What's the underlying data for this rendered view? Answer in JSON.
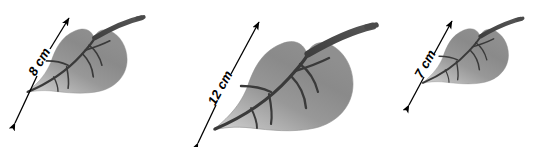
{
  "figure": {
    "background_color": "#ffffff",
    "width": 553,
    "height": 147
  },
  "palette": {
    "leaf_light": "#cdcdcd",
    "leaf_mid": "#969696",
    "leaf_dark": "#6e6e6e",
    "vein_color": "#3a3a3a",
    "stem_color": "#4a4a4a",
    "arrow_color": "#000000",
    "text_color": "#000000"
  },
  "leaves": [
    {
      "id": "leaf-1",
      "measurement_label": "8 cm",
      "value": 8,
      "unit": "cm",
      "scale": 0.72,
      "arrow_name": "dimension-arrow-8cm"
    },
    {
      "id": "leaf-2",
      "measurement_label": "12 cm",
      "value": 12,
      "unit": "cm",
      "scale": 1.0,
      "arrow_name": "dimension-arrow-12cm"
    },
    {
      "id": "leaf-3",
      "measurement_label": "7 cm",
      "value": 7,
      "unit": "cm",
      "scale": 0.62,
      "arrow_name": "dimension-arrow-7cm"
    }
  ],
  "icons": {
    "leaf": "leaf-icon",
    "stem": "stem-icon",
    "vein": "vein-icon",
    "arrow_double": "double-headed-arrow-icon"
  }
}
